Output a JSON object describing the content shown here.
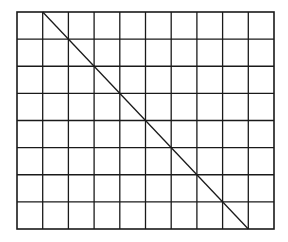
{
  "diagram": {
    "type": "grid-with-diagonal",
    "grid": {
      "columns": 10,
      "rows": 8,
      "left": 17,
      "top": 12,
      "right": 274,
      "bottom": 229,
      "line_color": "#1a1a1a",
      "background": "#ffffff"
    },
    "diagonal": {
      "from": {
        "column_line": 1,
        "row_line": 0
      },
      "to": {
        "column_line": 9,
        "row_line": 8
      },
      "color": "#1a1a1a"
    }
  }
}
